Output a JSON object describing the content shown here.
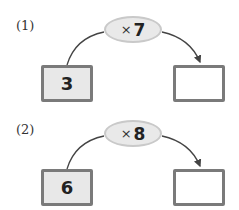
{
  "problems": [
    {
      "label": "(1)",
      "operator_symbol": "×",
      "operator_value": "7",
      "input": "3",
      "answer": ""
    },
    {
      "label": "(2)",
      "operator_symbol": "×",
      "operator_value": "8",
      "input": "6",
      "answer": ""
    }
  ],
  "colors": {
    "box_border": "#7a7a7a",
    "input_fill": "#e8e8e8",
    "ellipse_fill": "#e9e9e9",
    "arrow": "#444444"
  }
}
